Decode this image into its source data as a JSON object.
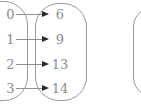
{
  "diagram": {
    "kind": "function-mapping",
    "left_set": [
      "0",
      "1",
      "2",
      "3"
    ],
    "right_set": [
      "6",
      "9",
      "13",
      "14"
    ],
    "mappings": [
      {
        "from": "0",
        "to": "6"
      },
      {
        "from": "1",
        "to": "9"
      },
      {
        "from": "2",
        "to": "13"
      },
      {
        "from": "3",
        "to": "14"
      }
    ],
    "colors": {
      "background": "#ffffff",
      "border": "#9a9a9a",
      "text": "#8c8c8c",
      "arrow_line": "#909090",
      "arrow_head": "#2a2a2a"
    }
  }
}
